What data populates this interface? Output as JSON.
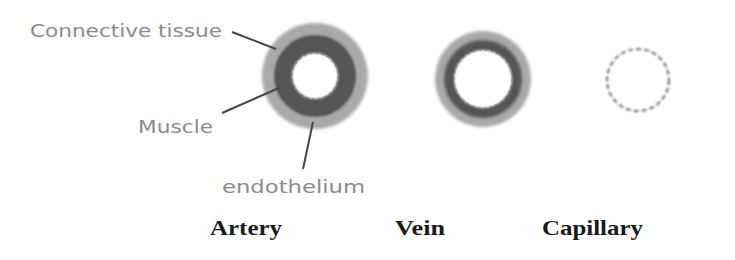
{
  "diagram": {
    "annotations": {
      "connective_tissue": "Connective tissue",
      "muscle": "Muscle",
      "endothelium": "endothelium"
    },
    "vessels": [
      {
        "name": "Artery",
        "layers": [
          "Connective tissue",
          "Muscle",
          "endothelium"
        ]
      },
      {
        "name": "Vein",
        "layers": [
          "Connective tissue",
          "Muscle",
          "endothelium"
        ]
      },
      {
        "name": "Capillary",
        "layers": [
          "endothelium"
        ]
      }
    ],
    "colors": {
      "connective_tissue": "#a9a9a9",
      "muscle": "#555555",
      "lumen": "#ffffff",
      "endothelium_dash": "#666666",
      "annotation_text": "#8a8a8a",
      "leader_line": "#444444",
      "title_text": "#1a1a1a"
    }
  }
}
